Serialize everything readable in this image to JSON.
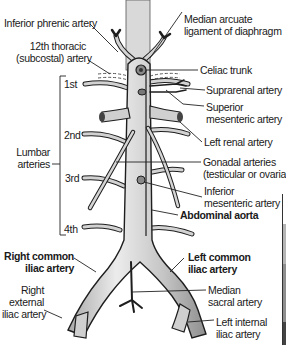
{
  "figure": {
    "colors": {
      "vessel_fill": "#c9c9c9",
      "vessel_highlight": "#eeeeee",
      "vessel_outline": "#1e1e1e",
      "leader_line": "#222222",
      "text": "#1a1a1a",
      "background": "#ffffff"
    }
  },
  "labels": {
    "inferior_phrenic": "Inferior phrenic artery",
    "subcostal_line1": "12th thoracic",
    "subcostal_line2": "(subcostal) artery",
    "median_arcuate_line1": "Median arcuate",
    "median_arcuate_line2": "ligament of diaphragm",
    "celiac_trunk": "Celiac trunk",
    "suprarenal": "Suprarenal artery",
    "sma_line1": "Superior",
    "sma_line2": "mesenteric artery",
    "left_renal": "Left renal artery",
    "gonadal_line1": "Gonadal arteries",
    "gonadal_line2": "(testicular or ovarian)",
    "ima_line1": "Inferior",
    "ima_line2": "mesenteric artery",
    "abdominal_aorta": "Abdominal aorta",
    "left_common_iliac_line1": "Left common",
    "left_common_iliac_line2": "iliac artery",
    "median_sacral_line1": "Median",
    "median_sacral_line2": "sacral artery",
    "left_internal_iliac_line1": "Left internal",
    "left_internal_iliac_line2": "iliac artery",
    "right_common_iliac_line1": "Right common",
    "right_common_iliac_line2": "iliac artery",
    "right_external_iliac_line1": "Right",
    "right_external_iliac_line2": "external",
    "right_external_iliac_line3": "iliac artery",
    "lumbar_line1": "Lumbar",
    "lumbar_line2": "arteries",
    "lumbar_1": "1st",
    "lumbar_2": "2nd",
    "lumbar_3": "3rd",
    "lumbar_4": "4th"
  },
  "side_panel": {
    "segments": [
      "#ffffff",
      "#b5b5b5",
      "#8e8e8e",
      "#444444"
    ]
  }
}
